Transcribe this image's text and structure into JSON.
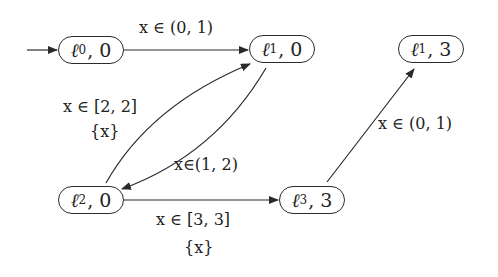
{
  "diagram": {
    "type": "timed-automaton-region-graph",
    "initial_node": "n0",
    "nodes": [
      {
        "id": "n0",
        "location": "ℓ",
        "index": "0",
        "value": "0",
        "label": "ℓ0, 0"
      },
      {
        "id": "n1",
        "location": "ℓ",
        "index": "1",
        "value": "0",
        "label": "ℓ1, 0"
      },
      {
        "id": "n2",
        "location": "ℓ",
        "index": "1",
        "value": "3",
        "label": "ℓ1, 3"
      },
      {
        "id": "n3",
        "location": "ℓ",
        "index": "2",
        "value": "0",
        "label": "ℓ2, 0"
      },
      {
        "id": "n4",
        "location": "ℓ",
        "index": "3",
        "value": "3",
        "label": "ℓ3, 3"
      }
    ],
    "edges": [
      {
        "from": "n0",
        "to": "n1",
        "guard": "x ∈ (0, 1)",
        "reset": ""
      },
      {
        "from": "n3",
        "to": "n1",
        "guard": "x ∈ [2, 2]",
        "reset": "{x}"
      },
      {
        "from": "n1",
        "to": "n3",
        "guard": "x∈(1, 2)",
        "reset": ""
      },
      {
        "from": "n3",
        "to": "n4",
        "guard": "x ∈ [3, 3]",
        "reset": "{x}"
      },
      {
        "from": "n4",
        "to": "n2",
        "guard": "x ∈ (0, 1)",
        "reset": ""
      }
    ],
    "colors": {
      "stroke": "#2a2a2a",
      "background": "#ffffff"
    }
  },
  "labels": {
    "e01_guard": "x ∈ (0, 1)",
    "e31_guard": "x ∈ [2, 2]",
    "e31_reset": "{x}",
    "e13_guard": "x∈(1, 2)",
    "e34_guard": "x ∈ [3, 3]",
    "e34_reset": "{x}",
    "e42_guard": "x ∈ (0, 1)"
  },
  "nodes_text": {
    "n0": {
      "sym": "ℓ",
      "sub": "0",
      "val": ", 0"
    },
    "n1": {
      "sym": "ℓ",
      "sub": "1",
      "val": ", 0"
    },
    "n2": {
      "sym": "ℓ",
      "sub": "1",
      "val": ", 3"
    },
    "n3": {
      "sym": "ℓ",
      "sub": "2",
      "val": ", 0"
    },
    "n4": {
      "sym": "ℓ",
      "sub": "3",
      "val": ", 3"
    }
  }
}
